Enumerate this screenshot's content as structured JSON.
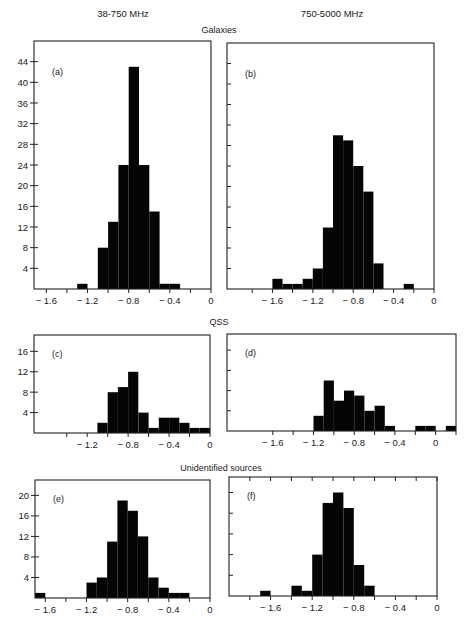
{
  "figure": {
    "column_headers": [
      "38-750 MHz",
      "750-5000 MHz"
    ],
    "row_titles": [
      "Galaxies",
      "QSS",
      "Unidentified sources"
    ]
  },
  "chart_data": [
    {
      "type": "bar",
      "panel": "(a)",
      "group": "Galaxies",
      "band": "38-750 MHz",
      "bin_width": 0.1,
      "bins": [
        [
          -1.3,
          1
        ],
        [
          -1.1,
          8
        ],
        [
          -1.0,
          13
        ],
        [
          -0.9,
          24
        ],
        [
          -0.8,
          43
        ],
        [
          -0.7,
          24
        ],
        [
          -0.6,
          15
        ],
        [
          -0.5,
          1
        ],
        [
          -0.4,
          1
        ]
      ],
      "xlim": [
        -1.72,
        0
      ],
      "ylim": [
        0,
        48
      ],
      "xticks": [
        -1.6,
        -1.4,
        -1.2,
        -1.0,
        -0.8,
        -0.6,
        -0.4,
        -0.2,
        0
      ],
      "xticklabels": {
        "-1.6": "− 1.6",
        "-1.2": "− 1.2",
        "-0.8": "− 0.8",
        "-0.4": "− 0.4",
        "0": "0"
      },
      "yticks": [
        4,
        8,
        12,
        16,
        20,
        24,
        28,
        32,
        36,
        40,
        44
      ],
      "show_ytick_labels": true,
      "xlabel": "",
      "ylabel": "",
      "grid": false
    },
    {
      "type": "bar",
      "panel": "(b)",
      "group": "Galaxies",
      "band": "750-5000 MHz",
      "bin_width": 0.1,
      "bins": [
        [
          -1.6,
          2
        ],
        [
          -1.5,
          1
        ],
        [
          -1.4,
          1
        ],
        [
          -1.3,
          2
        ],
        [
          -1.2,
          4
        ],
        [
          -1.1,
          12
        ],
        [
          -1.0,
          30
        ],
        [
          -0.9,
          29
        ],
        [
          -0.8,
          24
        ],
        [
          -0.7,
          19
        ],
        [
          -0.6,
          5
        ],
        [
          -0.3,
          1
        ]
      ],
      "xlim": [
        -2.05,
        0
      ],
      "ylim": [
        0,
        48
      ],
      "xticks": [
        -1.8,
        -1.6,
        -1.4,
        -1.2,
        -1.0,
        -0.8,
        -0.6,
        -0.4,
        -0.2,
        0
      ],
      "xticklabels": {
        "-1.6": "− 1.6",
        "-1.2": "− 1.2",
        "-0.8": "− 0.8",
        "-0.4": "− 0.4",
        "0": "0"
      },
      "yticks": [
        4,
        8,
        12,
        16,
        20,
        24,
        28,
        32,
        36,
        40,
        44
      ],
      "show_ytick_labels": false,
      "xlabel": "",
      "ylabel": "",
      "grid": false
    },
    {
      "type": "bar",
      "panel": "(c)",
      "group": "QSS",
      "band": "38-750 MHz",
      "bin_width": 0.1,
      "bins": [
        [
          -1.1,
          2
        ],
        [
          -1.0,
          8
        ],
        [
          -0.9,
          9
        ],
        [
          -0.8,
          12
        ],
        [
          -0.7,
          4
        ],
        [
          -0.6,
          1
        ],
        [
          -0.5,
          3
        ],
        [
          -0.4,
          3
        ],
        [
          -0.3,
          2
        ],
        [
          -0.2,
          1
        ],
        [
          -0.1,
          1
        ]
      ],
      "xlim": [
        -1.72,
        0
      ],
      "ylim": [
        0,
        19.2
      ],
      "xticks": [
        -1.4,
        -1.2,
        -1.0,
        -0.8,
        -0.6,
        -0.4,
        -0.2,
        0
      ],
      "xticklabels": {
        "-1.2": "− 1.2",
        "-0.8": "− 0.8",
        "-0.4": "− 0.4",
        "0": "0"
      },
      "yticks": [
        4,
        8,
        12,
        16
      ],
      "show_ytick_labels": true,
      "xlabel": "",
      "ylabel": "",
      "grid": false
    },
    {
      "type": "bar",
      "panel": "(d)",
      "group": "QSS",
      "band": "750-5000 MHz",
      "bin_width": 0.1,
      "bins": [
        [
          -1.2,
          3
        ],
        [
          -1.1,
          10
        ],
        [
          -1.0,
          6
        ],
        [
          -0.9,
          8
        ],
        [
          -0.8,
          7
        ],
        [
          -0.7,
          4
        ],
        [
          -0.6,
          5
        ],
        [
          -0.5,
          1
        ],
        [
          -0.2,
          1
        ],
        [
          -0.1,
          1
        ],
        [
          0.1,
          1
        ]
      ],
      "xlim": [
        -2.05,
        0.2
      ],
      "ylim": [
        0,
        19.2
      ],
      "xticks": [
        -1.6,
        -1.4,
        -1.2,
        -1.0,
        -0.8,
        -0.6,
        -0.4,
        -0.2,
        0,
        0.2
      ],
      "xticklabels": {
        "-1.6": "− 1.6",
        "-1.2": "− 1.2",
        "-0.8": "− 0.8",
        "-0.4": "− 0.4",
        "0": "0"
      },
      "yticks": [
        4,
        8,
        12,
        16
      ],
      "show_ytick_labels": false,
      "xlabel": "",
      "ylabel": "",
      "grid": false
    },
    {
      "type": "bar",
      "panel": "(e)",
      "group": "Unidentified sources",
      "band": "38-750 MHz",
      "bin_width": 0.1,
      "bins": [
        [
          -1.7,
          1
        ],
        [
          -1.2,
          3
        ],
        [
          -1.1,
          4
        ],
        [
          -1.0,
          11
        ],
        [
          -0.9,
          19
        ],
        [
          -0.8,
          17
        ],
        [
          -0.7,
          12
        ],
        [
          -0.6,
          4
        ],
        [
          -0.5,
          2
        ],
        [
          -0.4,
          1
        ],
        [
          -0.3,
          1
        ]
      ],
      "xlim": [
        -1.7,
        0
      ],
      "ylim": [
        0,
        23
      ],
      "xticks": [
        -1.6,
        -1.4,
        -1.2,
        -1.0,
        -0.8,
        -0.6,
        -0.4,
        -0.2,
        0
      ],
      "xticklabels": {
        "-1.6": "− 1.6",
        "-1.2": "− 1.2",
        "-0.8": "− 0.8",
        "-0.4": "− 0.4",
        "0": "0"
      },
      "yticks": [
        4,
        8,
        12,
        16,
        20
      ],
      "show_ytick_labels": true,
      "xlabel": "",
      "ylabel": "",
      "grid": false
    },
    {
      "type": "bar",
      "panel": "(f)",
      "group": "Unidentified sources",
      "band": "750-5000 MHz",
      "bin_width": 0.1,
      "bins": [
        [
          -1.7,
          1
        ],
        [
          -1.4,
          2
        ],
        [
          -1.3,
          1
        ],
        [
          -1.2,
          8
        ],
        [
          -1.1,
          18
        ],
        [
          -1.0,
          20
        ],
        [
          -0.9,
          17
        ],
        [
          -0.8,
          6
        ],
        [
          -0.7,
          2
        ]
      ],
      "xlim": [
        -2.0,
        0
      ],
      "ylim": [
        0,
        23
      ],
      "xticks": [
        -1.8,
        -1.6,
        -1.4,
        -1.2,
        -1.0,
        -0.8,
        -0.6,
        -0.4,
        -0.2,
        0
      ],
      "xticklabels": {
        "-1.6": "− 1.6",
        "-1.2": "− 1.2",
        "-0.8": "− 0.8",
        "-0.4": "− 0.4",
        "0": "0"
      },
      "yticks": [
        4,
        8,
        12,
        16,
        20
      ],
      "show_ytick_labels": false,
      "xlabel": "",
      "ylabel": "",
      "grid": false
    }
  ]
}
